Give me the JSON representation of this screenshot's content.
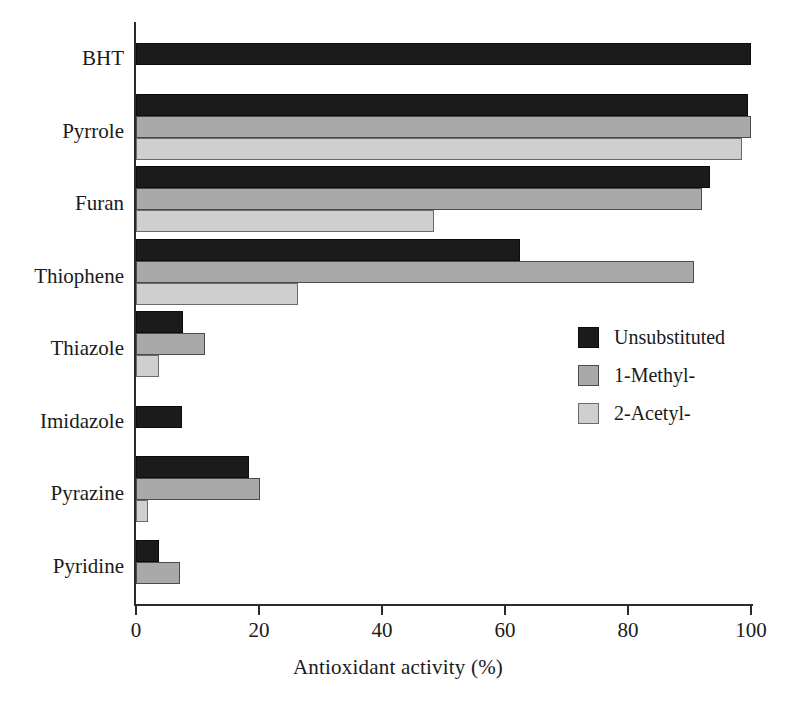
{
  "chart_data": {
    "type": "bar",
    "orientation": "horizontal",
    "title": "",
    "xlabel": "Antioxidant activity (%)",
    "ylabel": "",
    "xlim": [
      0,
      100
    ],
    "xticks": [
      0,
      20,
      40,
      60,
      80,
      100
    ],
    "xtick_labels": [
      "0",
      "20",
      "40",
      "60",
      "80",
      "100"
    ],
    "grid": false,
    "legend_position": "center-right",
    "categories": [
      "BHT",
      "Pyrrole",
      "Furan",
      "Thiophene",
      "Thiazole",
      "Imidazole",
      "Pyrazine",
      "Pyridine"
    ],
    "series": [
      {
        "name": "Unsubstituted",
        "color": "#1b1b1b",
        "values": [
          100,
          99.5,
          93.3,
          62.4,
          7.6,
          7.5,
          18.4,
          3.7
        ]
      },
      {
        "name": "1-Methyl-",
        "color": "#a9a9a9",
        "values": [
          0,
          100,
          92.0,
          90.8,
          11.3,
          0,
          20.1,
          7.1
        ]
      },
      {
        "name": "2-Acetyl-",
        "color": "#cfcfcf",
        "values": [
          0,
          98.6,
          48.5,
          26.4,
          3.8,
          0,
          2.0,
          0
        ]
      }
    ]
  },
  "axis": {
    "x_title": "Antioxidant activity (%)",
    "ticks": [
      {
        "value": 0,
        "label": "0"
      },
      {
        "value": 20,
        "label": "20"
      },
      {
        "value": 40,
        "label": "40"
      },
      {
        "value": 60,
        "label": "60"
      },
      {
        "value": 80,
        "label": "80"
      },
      {
        "value": 100,
        "label": "100"
      }
    ]
  },
  "legend": {
    "items": [
      {
        "label": "Unsubstituted",
        "swatch": "black-square-swatch"
      },
      {
        "label": "1-Methyl-",
        "swatch": "mid-gray-square-swatch"
      },
      {
        "label": "2-Acetyl-",
        "swatch": "light-gray-square-swatch"
      }
    ]
  }
}
